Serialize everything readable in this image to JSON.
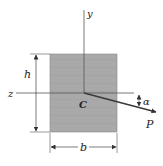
{
  "diagram": {
    "labels": {
      "y_axis": "y",
      "z_axis": "z",
      "centroid": "C",
      "height": "h",
      "width": "b",
      "angle": "α",
      "force": "P"
    },
    "colors": {
      "section_fill": "#a9a9a9",
      "line": "#444444",
      "arrow": "#3a3a3a",
      "text": "#222222"
    }
  }
}
